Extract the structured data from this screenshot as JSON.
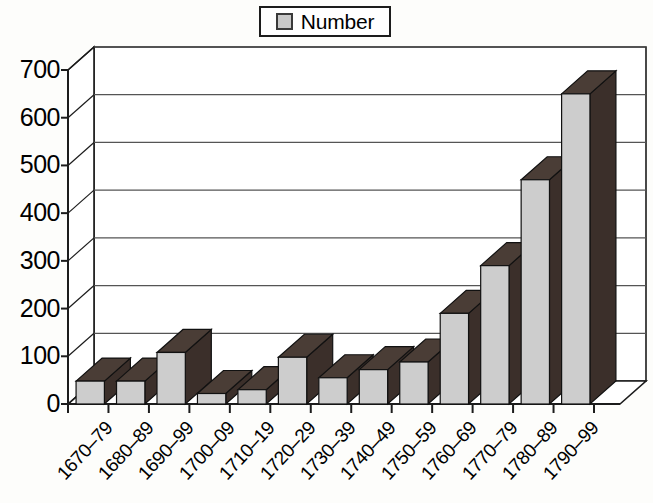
{
  "legend": {
    "label": "Number",
    "swatch_color": "#c9c9c9",
    "position": "top-center"
  },
  "axes": {
    "y_ticks": [
      "0",
      "100",
      "200",
      "300",
      "400",
      "500",
      "600",
      "700"
    ],
    "y_min": 0,
    "y_max": 700,
    "y_step": 100,
    "x_labels": [
      "1670–79",
      "1680–89",
      "1690–99",
      "1700–09",
      "1710–19",
      "1720–29",
      "1730–39",
      "1740–49",
      "1750–59",
      "1760–69",
      "1770–79",
      "1780–89",
      "1790–99"
    ]
  },
  "style": {
    "bar_front_color": "#cdcdcd",
    "bar_side_color": "#3b2f2a",
    "bar_top_color": "#4a3d36",
    "axis_color": "#1c1c1c",
    "gridline_color": "#555555",
    "background": "#fdfdfb"
  },
  "chart_data": {
    "type": "bar",
    "title": "",
    "subtitle": "",
    "xlabel": "",
    "ylabel": "",
    "ylim": [
      0,
      700
    ],
    "grid": true,
    "legend_position": "top-center",
    "three_d": true,
    "categories": [
      "1670–79",
      "1680–89",
      "1690–99",
      "1700–09",
      "1710–19",
      "1720–29",
      "1730–39",
      "1740–49",
      "1750–59",
      "1760–69",
      "1770–79",
      "1780–89",
      "1790–99"
    ],
    "series": [
      {
        "name": "Number",
        "values": [
          48,
          48,
          108,
          22,
          30,
          98,
          55,
          72,
          88,
          190,
          290,
          470,
          650
        ]
      }
    ],
    "values": [
      48,
      48,
      108,
      22,
      30,
      98,
      55,
      72,
      88,
      190,
      290,
      470,
      650
    ],
    "yticks": [
      0,
      100,
      200,
      300,
      400,
      500,
      600,
      700
    ]
  }
}
